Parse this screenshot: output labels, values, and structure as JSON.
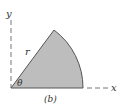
{
  "figure": {
    "caption": "(b)",
    "axes": {
      "x_label": "x",
      "y_label": "y"
    },
    "sector": {
      "radius_label": "r",
      "angle_label": "θ",
      "fill_color": "#bdbdbd",
      "stroke_color": "#444444"
    }
  }
}
